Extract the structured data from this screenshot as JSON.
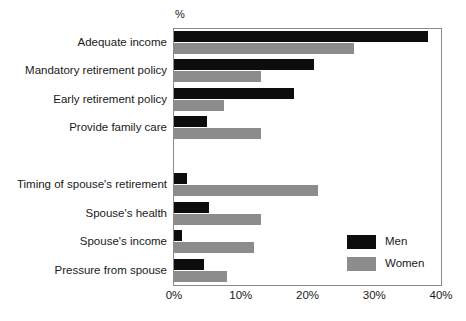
{
  "chart_data": {
    "type": "bar",
    "orientation": "horizontal",
    "title": "",
    "xlabel": "%",
    "ylabel": "",
    "xlim": [
      0,
      40
    ],
    "xticks": [
      0,
      10,
      20,
      30,
      40
    ],
    "xtick_labels": [
      "0%",
      "10%",
      "20%",
      "30%",
      "40%"
    ],
    "grid": false,
    "legend_position": "inside-bottom-right",
    "categories": [
      "Adequate income",
      "Mandatory retirement policy",
      "Early retirement policy",
      "Provide family care",
      "",
      "Timing of spouse's retirement",
      "Spouse's health",
      "Spouse's income",
      "Pressure from spouse"
    ],
    "series": [
      {
        "name": "Men",
        "color": "#0d0d0d",
        "values": [
          38.0,
          21.0,
          18.0,
          5.0,
          null,
          2.0,
          5.3,
          1.2,
          4.5
        ]
      },
      {
        "name": "Women",
        "color": "#8c8c8c",
        "values": [
          27.0,
          13.0,
          7.5,
          13.0,
          null,
          21.5,
          13.0,
          12.0,
          8.0
        ]
      }
    ]
  },
  "axis": {
    "unit_label": "%"
  },
  "legend": {
    "items": [
      {
        "label": "Men",
        "color": "#0d0d0d"
      },
      {
        "label": "Women",
        "color": "#8c8c8c"
      }
    ]
  }
}
